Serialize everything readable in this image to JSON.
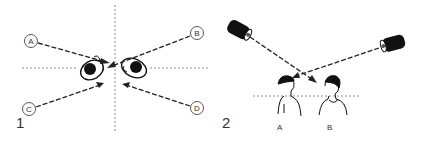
{
  "panels": [
    {
      "number": "1",
      "description": "Top view of two heads facing each other with four camera positions",
      "positions": [
        {
          "label": "A"
        },
        {
          "label": "B"
        },
        {
          "label": "C"
        },
        {
          "label": "D"
        }
      ]
    },
    {
      "number": "2",
      "description": "Side view of two people with two cameras crossing sight lines",
      "subjects": [
        {
          "label": "A"
        },
        {
          "label": "B"
        }
      ]
    }
  ]
}
